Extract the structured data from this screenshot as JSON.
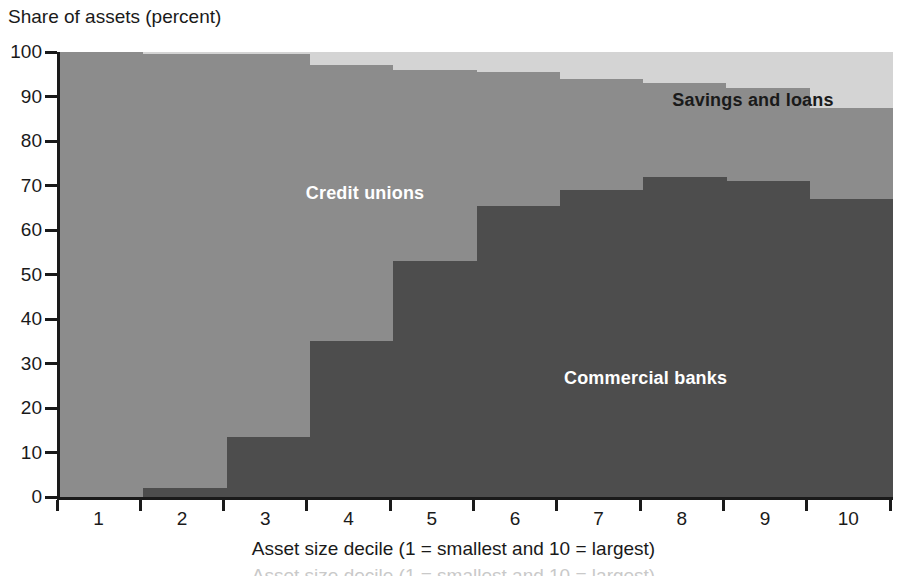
{
  "chart_data": {
    "type": "area",
    "title": "",
    "subtitle": "",
    "xlabel": "Asset size decile (1 = smallest and 10 = largest)",
    "ylabel": "Share of assets (percent)",
    "categories": [
      "1",
      "2",
      "3",
      "4",
      "5",
      "6",
      "7",
      "8",
      "9",
      "10"
    ],
    "x": [
      1,
      2,
      3,
      4,
      5,
      6,
      7,
      8,
      9,
      10
    ],
    "ylim": [
      0,
      100
    ],
    "xlim": [
      0.5,
      10.5
    ],
    "yticks": [
      0,
      10,
      20,
      30,
      40,
      50,
      60,
      70,
      80,
      90,
      100
    ],
    "ytick_labels": [
      "0",
      "10",
      "20",
      "30",
      "40",
      "50",
      "60",
      "70",
      "80",
      "90",
      "100"
    ],
    "grid": false,
    "stacked": true,
    "step": true,
    "legend_position": "in-plot-annotations",
    "series": [
      {
        "name": "Commercial banks",
        "color": "#4d4d4d",
        "values": [
          0,
          2,
          13.5,
          35,
          53,
          65.5,
          69,
          72,
          71,
          67
        ]
      },
      {
        "name": "Credit unions",
        "color": "#8c8c8c",
        "values": [
          100,
          97.5,
          86,
          62,
          43,
          30,
          25,
          21,
          21,
          20.5
        ]
      },
      {
        "name": "Savings and loans",
        "color": "#d4d4d4",
        "values": [
          0,
          0.5,
          0.5,
          3,
          4,
          4.5,
          6,
          7,
          8,
          12.5
        ]
      }
    ],
    "cumulative_tops": {
      "commercial_banks": [
        0,
        2,
        13.5,
        35,
        53,
        65.5,
        69,
        72,
        71,
        67
      ],
      "plus_credit_unions": [
        100,
        99.5,
        99.5,
        97,
        96,
        95.5,
        94,
        93,
        92,
        87.5
      ],
      "plus_savings_and_loans": [
        100,
        100,
        100,
        100,
        100,
        100,
        100,
        100,
        100,
        100
      ]
    },
    "annotations": [
      {
        "name": "savings-and-loans",
        "text": "Savings and loans",
        "x_pct": 73.5,
        "y_pct": 91.5,
        "color": "#1a1a1a"
      },
      {
        "name": "credit-unions",
        "text": "Credit unions",
        "x_pct": 29.5,
        "y_pct": 70.5,
        "color": "#ffffff"
      },
      {
        "name": "commercial-banks",
        "text": "Commercial banks",
        "x_pct": 60.5,
        "y_pct": 29.0,
        "color": "#ffffff"
      }
    ]
  },
  "colors": {
    "commercial_banks": "#4d4d4d",
    "credit_unions": "#8c8c8c",
    "savings_and_loans": "#d4d4d4",
    "axis": "#1a1a1a",
    "background": "#ffffff"
  },
  "caption": {
    "cropped_text": "Asset size decile (1 = smallest and 10 = largest)"
  }
}
